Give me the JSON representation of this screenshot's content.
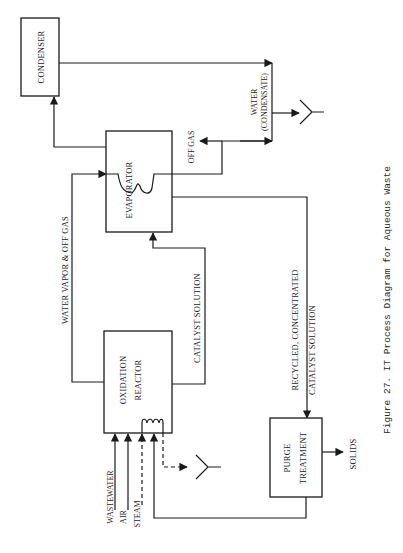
{
  "figure": {
    "caption": "Figure 27.   IT Process Diagram for Aqueous Waste",
    "orientation": "rotated -90 degrees (landscape page)"
  },
  "units": {
    "condenser": "CONDENSER",
    "evaporator": "EVAPORATOR",
    "oxidation_reactor_line1": "OXIDATION",
    "oxidation_reactor_line2": "REACTOR",
    "purge_line1": "PURGE",
    "purge_line2": "TREATMENT"
  },
  "streams": {
    "water_vapor_off_gas": "WATER  VAPOR  &  OFF  GAS",
    "catalyst_solution": "CATALYST  SOLUTION",
    "off_gas": "OFF  GAS",
    "water_line1": "WATER",
    "water_line2": "(CONDENSATE)",
    "recycled_line1": "RECYCLED,  CONCENTRATED",
    "recycled_line2": "CATALYST  SOLUTION",
    "solids": "SOLIDS",
    "wastewater": "WASTEWATER",
    "air": "AIR",
    "steam": "STEAM"
  },
  "colors": {
    "ink": "#1a1a1a",
    "paper": "#ffffff"
  }
}
